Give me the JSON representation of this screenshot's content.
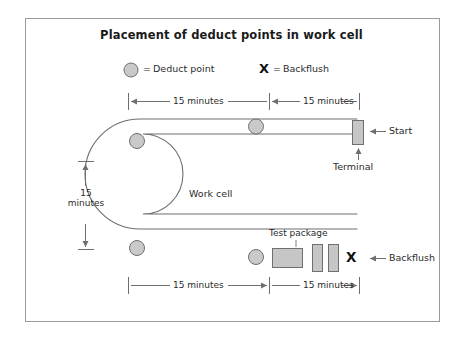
{
  "figure": {
    "title": "Placement of deduct points in work cell",
    "frame_color": "#9a9a9a",
    "background": "#ffffff"
  },
  "legend": {
    "items": [
      {
        "symbol": "deduct-point-circle",
        "equals": "=",
        "label": "Deduct point",
        "fill": "#c9c9c9",
        "stroke": "#6f6f6f"
      },
      {
        "symbol": "X",
        "equals": "=",
        "label": "Backflush",
        "fill": "#111111"
      }
    ]
  },
  "dimensions": {
    "top": [
      {
        "label": "15 minutes"
      },
      {
        "label": "15 minutes"
      }
    ],
    "left": {
      "label_line1": "15",
      "label_line2": "minutes"
    },
    "bottom": [
      {
        "label": "15 minutes"
      },
      {
        "label": "15 minutes"
      }
    ]
  },
  "work_cell": {
    "label": "Work cell",
    "line_color": "#6f6f6f",
    "deduct_points": [
      {
        "name": "top-left-deduct-point"
      },
      {
        "name": "top-middle-deduct-point"
      },
      {
        "name": "bottom-left-deduct-point"
      },
      {
        "name": "bottom-middle-deduct-point"
      }
    ]
  },
  "annotations": {
    "start": "Start",
    "terminal": "Terminal",
    "backflush": "Backflush",
    "test_package": "Test package",
    "backflush_mark": "X"
  },
  "colors": {
    "box_fill": "#c6c6c6",
    "box_stroke": "#6f6f6f",
    "circle_fill": "#c9c9c9",
    "circle_stroke": "#6f6f6f",
    "line": "#6f6f6f",
    "text": "#2b2b2b"
  }
}
